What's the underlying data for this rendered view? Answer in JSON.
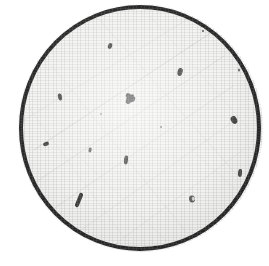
{
  "view": {
    "width": 269,
    "height": 266,
    "background_color": "#ffffff",
    "caption": ""
  },
  "disc": {
    "label": "filter membrane disc",
    "center_x": 140,
    "center_y": 128,
    "radius_x": 119,
    "radius_y": 121,
    "fill_color": "#f2f2f0",
    "ring_color": "#0d0d0d",
    "ring_width_px": 4,
    "texture": "paper grain with faint diagonal scratch lines"
  },
  "scratches": {
    "label": "surface scratch lines",
    "color": "#b9b9b6",
    "lines": [
      {
        "x1": 34,
        "y1": 150,
        "x2": 215,
        "y2": 30,
        "w": 0.8,
        "o": 0.55
      },
      {
        "x1": 30,
        "y1": 186,
        "x2": 224,
        "y2": 56,
        "w": 0.7,
        "o": 0.45
      },
      {
        "x1": 46,
        "y1": 214,
        "x2": 233,
        "y2": 86,
        "w": 0.7,
        "o": 0.4
      },
      {
        "x1": 70,
        "y1": 238,
        "x2": 238,
        "y2": 118,
        "w": 0.6,
        "o": 0.35
      },
      {
        "x1": 24,
        "y1": 120,
        "x2": 196,
        "y2": 14,
        "w": 0.6,
        "o": 0.32
      },
      {
        "x1": 110,
        "y1": 248,
        "x2": 243,
        "y2": 150,
        "w": 0.6,
        "o": 0.3
      },
      {
        "x1": 96,
        "y1": 16,
        "x2": 238,
        "y2": 176,
        "w": 0.6,
        "o": 0.3
      },
      {
        "x1": 52,
        "y1": 66,
        "x2": 186,
        "y2": 232,
        "w": 0.6,
        "o": 0.26
      },
      {
        "x1": 150,
        "y1": 16,
        "x2": 248,
        "y2": 128,
        "w": 0.5,
        "o": 0.24
      },
      {
        "x1": 26,
        "y1": 104,
        "x2": 126,
        "y2": 240,
        "w": 0.5,
        "o": 0.24
      },
      {
        "x1": 160,
        "y1": 120,
        "x2": 236,
        "y2": 190,
        "w": 0.5,
        "o": 0.22
      },
      {
        "x1": 62,
        "y1": 140,
        "x2": 170,
        "y2": 244,
        "w": 0.5,
        "o": 0.2
      }
    ]
  },
  "particles": {
    "label": "counted particles",
    "count": 16,
    "color": "#141414",
    "items": [
      {
        "id": "p01",
        "x": 110,
        "y": 46,
        "w": 4,
        "h": 6,
        "rot": 20,
        "shape": "blob",
        "opacity": 0.92
      },
      {
        "id": "p02",
        "x": 203,
        "y": 31,
        "w": 2,
        "h": 2,
        "rot": 0,
        "shape": "dot",
        "opacity": 0.8
      },
      {
        "id": "p03",
        "x": 180,
        "y": 72,
        "w": 5,
        "h": 8,
        "rot": 12,
        "shape": "blob",
        "opacity": 0.95
      },
      {
        "id": "p04",
        "x": 239,
        "y": 70,
        "w": 2,
        "h": 3,
        "rot": 0,
        "shape": "dot",
        "opacity": 0.72
      },
      {
        "id": "p05",
        "x": 60,
        "y": 97,
        "w": 4,
        "h": 7,
        "rot": -14,
        "shape": "blob",
        "opacity": 0.9
      },
      {
        "id": "p06",
        "x": 130,
        "y": 99,
        "w": 11,
        "h": 11,
        "rot": 25,
        "shape": "cluster",
        "opacity": 0.97
      },
      {
        "id": "p07",
        "x": 234,
        "y": 120,
        "w": 6,
        "h": 8,
        "rot": -32,
        "shape": "blob",
        "opacity": 0.88
      },
      {
        "id": "p08",
        "x": 46,
        "y": 144,
        "w": 6,
        "h": 4,
        "rot": -22,
        "shape": "blob",
        "opacity": 0.9
      },
      {
        "id": "p09",
        "x": 90,
        "y": 150,
        "w": 3,
        "h": 5,
        "rot": 8,
        "shape": "blob",
        "opacity": 0.72
      },
      {
        "id": "p10",
        "x": 161,
        "y": 127,
        "w": 2,
        "h": 2,
        "rot": 0,
        "shape": "dot",
        "opacity": 0.62
      },
      {
        "id": "p11",
        "x": 126,
        "y": 160,
        "w": 4,
        "h": 9,
        "rot": 6,
        "shape": "blob",
        "opacity": 0.93
      },
      {
        "id": "p12",
        "x": 240,
        "y": 173,
        "w": 4,
        "h": 8,
        "rot": 4,
        "shape": "blob",
        "opacity": 0.86
      },
      {
        "id": "p13",
        "x": 79,
        "y": 200,
        "w": 4,
        "h": 15,
        "rot": 22,
        "shape": "fiber",
        "opacity": 0.94
      },
      {
        "id": "p14",
        "x": 192,
        "y": 199,
        "w": 6,
        "h": 7,
        "rot": -10,
        "shape": "ring",
        "opacity": 0.74
      },
      {
        "id": "p15",
        "x": 155,
        "y": 247,
        "w": 3,
        "h": 3,
        "rot": 0,
        "shape": "dot",
        "opacity": 0.55
      },
      {
        "id": "p16",
        "x": 101,
        "y": 114,
        "w": 2,
        "h": 2,
        "rot": 0,
        "shape": "dot",
        "opacity": 0.45
      }
    ]
  }
}
